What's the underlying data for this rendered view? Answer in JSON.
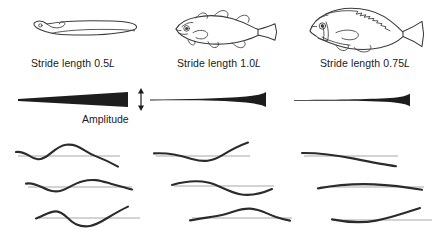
{
  "figure": {
    "amplitude_label": "Amplitude",
    "background_color": "#ffffff",
    "ink_color": "#2b2b2b",
    "axis_color": "#9d9d9d",
    "wedge_color": "#1d1d1d"
  },
  "columns": [
    {
      "id": "anguilliform",
      "fish_name": "eel",
      "stride_label_prefix": "Stride length ",
      "stride_value": "0.5",
      "stride_unit": "L",
      "stride_label_full": "Stride length 0.5L",
      "envelope": {
        "start_height": 2.0,
        "end_height": 15.0,
        "start_x": 18,
        "end_x": 128,
        "description": "amplitude grows steadily from head to tail"
      },
      "has_amplitude_arrow": true,
      "waves": [
        {
          "row": 1,
          "amplitude": 11,
          "wavelength": 72,
          "phase": 0.0
        },
        {
          "row": 2,
          "amplitude": 11,
          "wavelength": 72,
          "phase": 0.33
        },
        {
          "row": 3,
          "amplitude": 11,
          "wavelength": 72,
          "phase": 0.66
        }
      ]
    },
    {
      "id": "subcarangiform",
      "fish_name": "cod",
      "stride_label_prefix": "Stride length ",
      "stride_value": "1.0",
      "stride_unit": "L",
      "stride_label_full": "Stride length 1.0L",
      "envelope": {
        "start_height": 1.2,
        "end_height": 12.0,
        "start_x": 10,
        "end_x": 120,
        "description": "amplitude small along body, flaring near the tail"
      },
      "has_amplitude_arrow": false,
      "waves": [
        {
          "row": 1,
          "amplitude": 7,
          "wavelength": 104,
          "phase": 0.0
        },
        {
          "row": 2,
          "amplitude": 7,
          "wavelength": 104,
          "phase": 0.33
        },
        {
          "row": 3,
          "amplitude": 7,
          "wavelength": 104,
          "phase": 0.66
        }
      ]
    },
    {
      "id": "carangiform",
      "fish_name": "perch",
      "stride_label_prefix": "Stride length ",
      "stride_value": "0.75",
      "stride_unit": "L",
      "stride_label_full": "Stride length 0.75L",
      "envelope": {
        "start_height": 0.9,
        "end_height": 9.0,
        "start_x": 8,
        "end_x": 118,
        "description": "amplitude confined to the rear of the body"
      },
      "has_amplitude_arrow": false,
      "waves": [
        {
          "row": 1,
          "amplitude": 3.5,
          "wavelength": 150,
          "phase": 0.0
        },
        {
          "row": 2,
          "amplitude": 3.5,
          "wavelength": 150,
          "phase": 0.33
        },
        {
          "row": 3,
          "amplitude": 3.5,
          "wavelength": 150,
          "phase": 0.66
        }
      ]
    }
  ]
}
